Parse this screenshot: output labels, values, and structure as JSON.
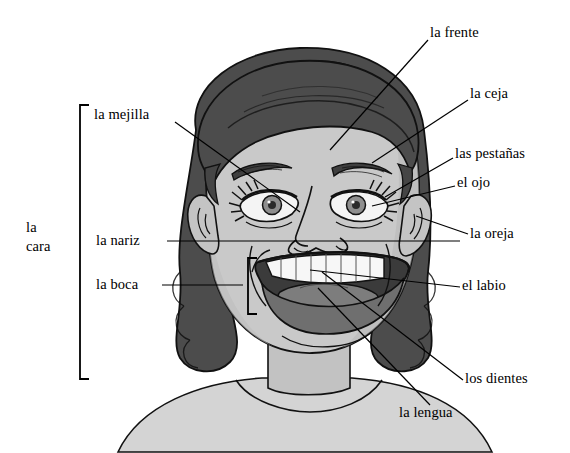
{
  "diagram": {
    "title": "la cara",
    "language": "Spanish",
    "width": 570,
    "height": 453,
    "background_color": "#ffffff",
    "line_color": "#000000",
    "ink_color": "#1a1a1a",
    "palette": {
      "hair_dark": "#4c4c4c",
      "hair_shadow": "#3c3c3c",
      "hair_highlight": "#5e5e5e",
      "skin_light": "#c9c9c9",
      "skin_mid": "#b9b9b9",
      "skin_shadow": "#a8a8a8",
      "mouth_inner": "#3a3a3a",
      "lip": "#6e6e6e",
      "tongue": "#7b7b7b",
      "teeth": "#f7f7f7",
      "eye_iris": "#8e8e8e",
      "eye_white": "#f2f2f2",
      "shirt": "#d2d2d2"
    }
  },
  "group_label": {
    "name": "la-cara",
    "line1": "la",
    "line2": "cara",
    "text": "la cara",
    "x": 26,
    "y": 220,
    "bracket": {
      "x": 80,
      "top": 105,
      "bottom": 379,
      "arm": 9
    }
  },
  "mouth_bracket": {
    "name": "boca-bracket",
    "x": 248,
    "top": 258,
    "bottom": 314,
    "arm": 9
  },
  "labels": [
    {
      "id": "la-mejilla",
      "text": "la mejilla",
      "side": "left",
      "x": 94,
      "y": 106,
      "leader": [
        [
          175,
          122
        ],
        [
          300,
          212
        ]
      ]
    },
    {
      "id": "la-nariz",
      "text": "la nariz",
      "side": "left",
      "x": 96,
      "y": 234,
      "leader": [
        [
          167,
          241
        ],
        [
          404,
          241
        ],
        [
          460,
          241
        ]
      ]
    },
    {
      "id": "la-boca",
      "text": "la boca",
      "side": "left",
      "x": 96,
      "y": 278,
      "leader": [
        [
          162,
          285
        ],
        [
          243,
          285
        ]
      ]
    },
    {
      "id": "la-frente",
      "text": "la frente",
      "side": "right",
      "x": 430,
      "y": 26,
      "leader": [
        [
          428,
          40
        ],
        [
          330,
          150
        ]
      ]
    },
    {
      "id": "la-ceja",
      "text": "la ceja",
      "side": "right",
      "x": 470,
      "y": 87,
      "leader": [
        [
          468,
          100
        ],
        [
          372,
          163
        ]
      ]
    },
    {
      "id": "las-pestanas",
      "text": "las pestañas",
      "side": "right",
      "x": 455,
      "y": 147,
      "leader": [
        [
          453,
          158
        ],
        [
          385,
          197
        ]
      ]
    },
    {
      "id": "el-ojo",
      "text": "el ojo",
      "side": "right",
      "x": 457,
      "y": 176,
      "leader": [
        [
          455,
          186
        ],
        [
          372,
          206
        ]
      ]
    },
    {
      "id": "la-oreja",
      "text": "la oreja",
      "side": "right",
      "x": 470,
      "y": 227,
      "leader": [
        [
          468,
          234
        ],
        [
          416,
          216
        ]
      ]
    },
    {
      "id": "el-labio",
      "text": "el labio",
      "side": "right",
      "x": 462,
      "y": 279,
      "leader": [
        [
          460,
          287
        ],
        [
          310,
          270
        ]
      ]
    },
    {
      "id": "los-dientes",
      "text": "los dientes",
      "side": "right",
      "x": 465,
      "y": 372,
      "leader": [
        [
          463,
          380
        ],
        [
          322,
          272
        ]
      ]
    },
    {
      "id": "la-lengua",
      "text": "la lengua",
      "side": "right",
      "x": 399,
      "y": 406,
      "leader": [
        [
          430,
          405
        ],
        [
          318,
          288
        ]
      ]
    }
  ]
}
